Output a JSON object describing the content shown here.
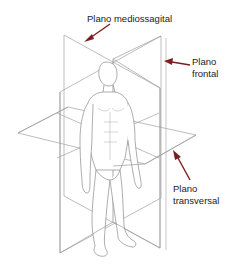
{
  "diagram": {
    "labels": {
      "mediossagital": "Plano mediossagital",
      "frontal_line1": "Plano",
      "frontal_line2": "frontal",
      "transversal_line1": "Plano",
      "transversal_line2": "transversal"
    },
    "colors": {
      "arrow": "#7a1f1f",
      "plane_line": "#9a9a9a",
      "figure_line": "#8a8a8a",
      "text": "#222222",
      "background": "#ffffff"
    },
    "planes": [
      "mediossagital",
      "frontal",
      "transversal"
    ]
  }
}
